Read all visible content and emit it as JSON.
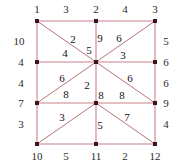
{
  "figure": {
    "type": "graph-diagram",
    "colors": {
      "edge": "#c9828c",
      "diagonal": "#b5737f",
      "node": "#3a1520",
      "label": "#1a1a1a",
      "background": "#ffffff"
    },
    "nodes": [
      {
        "id": "n1",
        "x": 37,
        "y": 21
      },
      {
        "id": "n2",
        "x": 96,
        "y": 21
      },
      {
        "id": "n3",
        "x": 155,
        "y": 21
      },
      {
        "id": "n4",
        "x": 37,
        "y": 62
      },
      {
        "id": "n5",
        "x": 96,
        "y": 62
      },
      {
        "id": "n6",
        "x": 155,
        "y": 62
      },
      {
        "id": "n7",
        "x": 37,
        "y": 103
      },
      {
        "id": "n8",
        "x": 96,
        "y": 103
      },
      {
        "id": "n9",
        "x": 155,
        "y": 103
      },
      {
        "id": "n10",
        "x": 37,
        "y": 144
      },
      {
        "id": "n11",
        "x": 96,
        "y": 144
      },
      {
        "id": "n12",
        "x": 155,
        "y": 144
      }
    ],
    "edges": [
      {
        "from": "n1",
        "to": "n2",
        "kind": "straight"
      },
      {
        "from": "n2",
        "to": "n3",
        "kind": "straight"
      },
      {
        "from": "n4",
        "to": "n5",
        "kind": "straight"
      },
      {
        "from": "n5",
        "to": "n6",
        "kind": "straight"
      },
      {
        "from": "n7",
        "to": "n8",
        "kind": "straight"
      },
      {
        "from": "n8",
        "to": "n9",
        "kind": "straight"
      },
      {
        "from": "n10",
        "to": "n11",
        "kind": "straight"
      },
      {
        "from": "n11",
        "to": "n12",
        "kind": "straight"
      },
      {
        "from": "n1",
        "to": "n4",
        "kind": "straight"
      },
      {
        "from": "n4",
        "to": "n7",
        "kind": "straight"
      },
      {
        "from": "n7",
        "to": "n10",
        "kind": "straight"
      },
      {
        "from": "n2",
        "to": "n5",
        "kind": "straight"
      },
      {
        "from": "n5",
        "to": "n8",
        "kind": "straight"
      },
      {
        "from": "n8",
        "to": "n11",
        "kind": "straight"
      },
      {
        "from": "n3",
        "to": "n6",
        "kind": "straight"
      },
      {
        "from": "n6",
        "to": "n9",
        "kind": "straight"
      },
      {
        "from": "n9",
        "to": "n12",
        "kind": "straight"
      },
      {
        "from": "n1",
        "to": "n5",
        "kind": "diagonal"
      },
      {
        "from": "n5",
        "to": "n3",
        "kind": "diagonal"
      },
      {
        "from": "n5",
        "to": "n7",
        "kind": "diagonal"
      },
      {
        "from": "n5",
        "to": "n9",
        "kind": "diagonal"
      },
      {
        "from": "n8",
        "to": "n10",
        "kind": "diagonal"
      },
      {
        "from": "n8",
        "to": "n12",
        "kind": "diagonal"
      }
    ],
    "labels": {
      "top": [
        {
          "text": "1",
          "x": 37,
          "y": 9
        },
        {
          "text": "3",
          "x": 66,
          "y": 9
        },
        {
          "text": "2",
          "x": 96,
          "y": 9
        },
        {
          "text": "4",
          "x": 125,
          "y": 9
        },
        {
          "text": "3",
          "x": 155,
          "y": 9
        }
      ],
      "bottom": [
        {
          "text": "10",
          "x": 37,
          "y": 156
        },
        {
          "text": "5",
          "x": 66,
          "y": 156
        },
        {
          "text": "11",
          "x": 96,
          "y": 156
        },
        {
          "text": "2",
          "x": 125,
          "y": 156
        },
        {
          "text": "12",
          "x": 155,
          "y": 156
        }
      ],
      "left": [
        {
          "text": "10",
          "x": 19,
          "y": 41
        },
        {
          "text": "4",
          "x": 21,
          "y": 62
        },
        {
          "text": "4",
          "x": 21,
          "y": 83
        },
        {
          "text": "7",
          "x": 21,
          "y": 103
        },
        {
          "text": "3",
          "x": 21,
          "y": 124
        }
      ],
      "right": [
        {
          "text": "5",
          "x": 166,
          "y": 41
        },
        {
          "text": "6",
          "x": 166,
          "y": 62
        },
        {
          "text": "6",
          "x": 166,
          "y": 83
        },
        {
          "text": "9",
          "x": 166,
          "y": 103
        },
        {
          "text": "4",
          "x": 166,
          "y": 124
        }
      ],
      "interior": [
        {
          "text": "2",
          "x": 73,
          "y": 39
        },
        {
          "text": "9",
          "x": 100,
          "y": 38
        },
        {
          "text": "6",
          "x": 119,
          "y": 38
        },
        {
          "text": "5",
          "x": 89,
          "y": 50
        },
        {
          "text": "4",
          "x": 65,
          "y": 53
        },
        {
          "text": "3",
          "x": 123,
          "y": 55
        },
        {
          "text": "6",
          "x": 62,
          "y": 78
        },
        {
          "text": "6",
          "x": 130,
          "y": 78
        },
        {
          "text": "2",
          "x": 87,
          "y": 85
        },
        {
          "text": "8",
          "x": 66,
          "y": 94
        },
        {
          "text": "8",
          "x": 101,
          "y": 95
        },
        {
          "text": "8",
          "x": 122,
          "y": 95
        },
        {
          "text": "3",
          "x": 62,
          "y": 117
        },
        {
          "text": "5",
          "x": 100,
          "y": 125
        },
        {
          "text": "7",
          "x": 127,
          "y": 117
        }
      ]
    }
  }
}
